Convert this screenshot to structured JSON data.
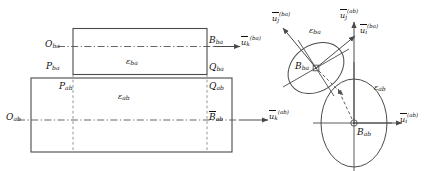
{
  "figure": {
    "type": "geometry-diagram",
    "background": "#ffffff",
    "line_color": "#4a4a4a",
    "text_color": "#111111"
  },
  "left_panel": {
    "rect_ba": {
      "name": "upper-rectangle-ba",
      "region_label": "ε",
      "region_sub": "ba",
      "corner_left_top_label": "O",
      "corner_left_top_sub": "ba",
      "corner_right_top_label": "B",
      "corner_right_top_sub": "ba",
      "corner_left_bottom_label": "P",
      "corner_left_bottom_sub": "ba",
      "corner_right_bottom_label": "Q",
      "corner_right_bottom_sub": "ba"
    },
    "rect_ab": {
      "name": "lower-rectangle-ab",
      "region_label": "ε",
      "region_sub": "ab",
      "corner_left_top_label": "P",
      "corner_left_top_sub": "ab",
      "corner_right_top_label": "Q",
      "corner_right_top_sub": "ab",
      "origin_label": "O",
      "origin_sub": "ab",
      "center_label": "B",
      "center_sub": "ab",
      "center_overbar": true
    },
    "vectors": [
      {
        "base": "u",
        "sub": "k",
        "sup": "(ba)",
        "direction": "right"
      },
      {
        "base": "u",
        "sub": "k",
        "sup": "(ab)",
        "direction": "right"
      }
    ]
  },
  "right_panel": {
    "ellipse_ba": {
      "name": "tilted-ellipse-ba",
      "region_label": "ε",
      "region_sub": "ba",
      "center_label": "B",
      "center_sub": "ba",
      "tilt_deg": -35
    },
    "ellipse_ab": {
      "name": "vertical-ellipse-ab",
      "region_label": "ε",
      "region_sub": "ab",
      "center_label": "B",
      "center_sub": "ab",
      "tilt_deg": 0
    },
    "vectors": [
      {
        "base": "u",
        "sub": "j",
        "sup": "(ba)",
        "direction": "up-left"
      },
      {
        "base": "u",
        "sub": "j",
        "sup": "(ab)",
        "direction": "up"
      },
      {
        "base": "u",
        "sub": "i",
        "sup": "(ba)",
        "direction": "up-right"
      },
      {
        "base": "u",
        "sub": "i",
        "sup": "(ab)",
        "direction": "right"
      }
    ],
    "connector": {
      "name": "dashed-distance-arrow",
      "style": "dashed-double-headed"
    }
  }
}
